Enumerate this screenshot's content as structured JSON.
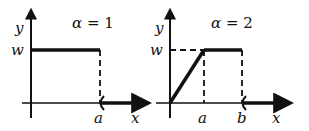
{
  "panels": [
    {
      "id": "left",
      "title_symbol": "α",
      "title_eq": " = ",
      "title_value": "1",
      "y_label": "y",
      "x_label": "x",
      "level_label": "w",
      "tick_labels": [
        "a"
      ]
    },
    {
      "id": "right",
      "title_symbol": "α",
      "title_eq": " = ",
      "title_value": "2",
      "y_label": "y",
      "x_label": "x",
      "level_label": "w",
      "tick_labels": [
        "a",
        "b"
      ]
    }
  ],
  "colors": {
    "ink": "#111111",
    "background": "#ffffff"
  }
}
